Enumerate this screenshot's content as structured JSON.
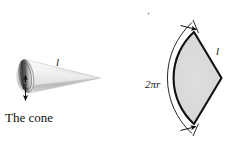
{
  "figure": {
    "background_color": "#ffffff",
    "ink_color": "#1a1a1a",
    "width": 238,
    "height": 164
  },
  "cone_figure": {
    "caption": "The cone",
    "slant_label": "l",
    "radius_label": "r",
    "body_fill_light": "#f2f2f2",
    "body_fill_mid": "#cfcfcf",
    "base_fill_dark": "#4a4a4a",
    "base_fill_light": "#e8e8e8"
  },
  "sector_figure": {
    "arc_label": "2πr",
    "slant_label": "l",
    "sector_fill": "#d9d9d9",
    "sector_stroke": "#111111"
  },
  "speck": {
    "present": true
  }
}
